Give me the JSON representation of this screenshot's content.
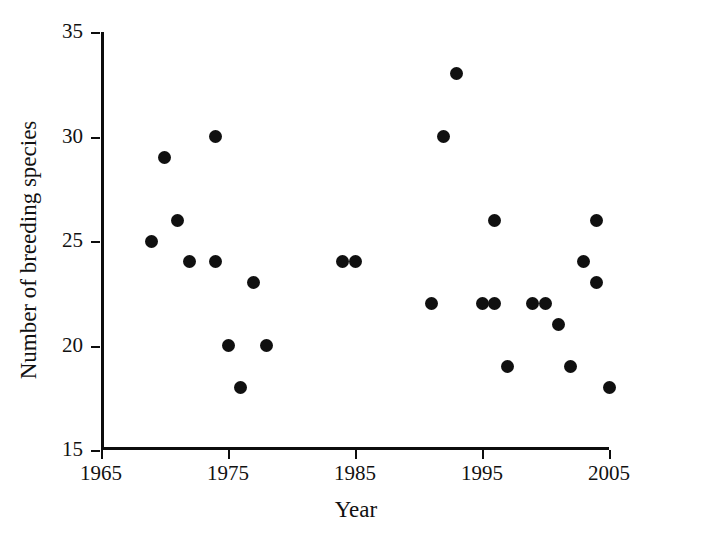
{
  "chart_data": {
    "type": "scatter",
    "title": "",
    "xlabel": "Year",
    "ylabel": "Number of breeding species",
    "xlim": [
      1965,
      2005
    ],
    "ylim": [
      15,
      35
    ],
    "xticks": [
      1965,
      1975,
      1985,
      1995,
      2005
    ],
    "yticks": [
      15,
      20,
      25,
      30,
      35
    ],
    "xtick_labels": [
      "1965",
      "1975",
      "1985",
      "1995",
      "2005"
    ],
    "ytick_labels": [
      "15",
      "20",
      "25",
      "30",
      "35"
    ],
    "grid": false,
    "legend": false,
    "marker": "filled-circle",
    "marker_color": "#101010",
    "points": [
      {
        "x": 1969,
        "y": 25
      },
      {
        "x": 1970,
        "y": 29
      },
      {
        "x": 1971,
        "y": 26
      },
      {
        "x": 1972,
        "y": 24
      },
      {
        "x": 1974,
        "y": 30
      },
      {
        "x": 1974,
        "y": 24
      },
      {
        "x": 1975,
        "y": 20
      },
      {
        "x": 1976,
        "y": 18
      },
      {
        "x": 1977,
        "y": 23
      },
      {
        "x": 1978,
        "y": 20
      },
      {
        "x": 1984,
        "y": 24
      },
      {
        "x": 1985,
        "y": 24
      },
      {
        "x": 1991,
        "y": 22
      },
      {
        "x": 1992,
        "y": 30
      },
      {
        "x": 1993,
        "y": 33
      },
      {
        "x": 1995,
        "y": 22
      },
      {
        "x": 1996,
        "y": 22
      },
      {
        "x": 1996,
        "y": 26
      },
      {
        "x": 1997,
        "y": 19
      },
      {
        "x": 1999,
        "y": 22
      },
      {
        "x": 2000,
        "y": 22
      },
      {
        "x": 2001,
        "y": 21
      },
      {
        "x": 2002,
        "y": 19
      },
      {
        "x": 2003,
        "y": 24
      },
      {
        "x": 2004,
        "y": 23
      },
      {
        "x": 2004,
        "y": 26
      },
      {
        "x": 2005,
        "y": 18
      }
    ]
  }
}
